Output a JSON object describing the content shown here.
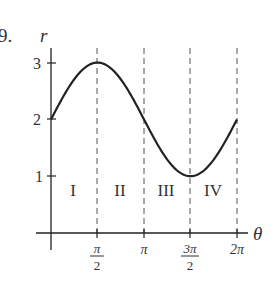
{
  "problem_number": "9.",
  "chart_data": {
    "type": "line",
    "title": "",
    "function": "r = 2 + sin(theta)",
    "xlabel": "θ",
    "ylabel": "r",
    "x_ticks": [
      "",
      "π/2",
      "π",
      "3π/2",
      "2π"
    ],
    "x_tick_labels": [
      {
        "kind": "fraction",
        "num": "π",
        "den": "2"
      },
      {
        "kind": "plain",
        "text": "π"
      },
      {
        "kind": "fraction",
        "num": "3π",
        "den": "2"
      },
      {
        "kind": "plain",
        "text": "2π"
      }
    ],
    "y_ticks": [
      "1",
      "2",
      "3"
    ],
    "x": [
      0,
      0.7854,
      1.5708,
      2.3562,
      3.1416,
      3.927,
      4.7124,
      5.4978,
      6.2832
    ],
    "values": [
      2,
      2.707,
      3,
      2.707,
      2,
      1.293,
      1,
      1.293,
      2
    ],
    "xlim": [
      0,
      6.2832
    ],
    "ylim": [
      0,
      3
    ],
    "grid": false,
    "dashed_verticals_at": [
      "π/2",
      "π",
      "3π/2",
      "2π"
    ],
    "regions": [
      "I",
      "II",
      "III",
      "IV"
    ]
  },
  "colors": {
    "ink": "#222222",
    "dash": "#555555"
  }
}
